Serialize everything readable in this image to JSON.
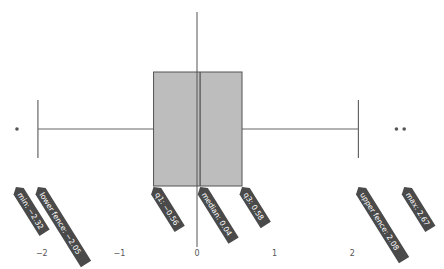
{
  "chart_data": {
    "type": "box",
    "title": "",
    "xlabel": "",
    "ylabel": "",
    "orientation": "horizontal",
    "xlim": [
      -2.5,
      3.1
    ],
    "x_ticks": [
      -2,
      -1,
      0,
      1,
      2
    ],
    "x_tick_labels": [
      "−2",
      "−1",
      "0",
      "1",
      "2"
    ],
    "grid": false,
    "stats": {
      "min": -2.32,
      "lower_fence": -2.05,
      "q1": -0.56,
      "median": 0.04,
      "q3": 0.58,
      "upper_fence": 2.08,
      "max": 2.67
    },
    "outliers": [
      -2.32,
      2.57,
      2.67
    ],
    "annotations": [
      {
        "key": "min",
        "label": "min: −2.32",
        "value": -2.32
      },
      {
        "key": "lower_fence",
        "label": "lower fence: −2.05",
        "value": -2.05
      },
      {
        "key": "q1",
        "label": "q1: −0.56",
        "value": -0.56
      },
      {
        "key": "median",
        "label": "median: 0.04",
        "value": 0.04
      },
      {
        "key": "q3",
        "label": "q3: 0.58",
        "value": 0.58
      },
      {
        "key": "upper_fence",
        "label": "upper fence: 2.08",
        "value": 2.08
      },
      {
        "key": "max",
        "label": "max: 2.67",
        "value": 2.67
      }
    ],
    "colors": {
      "box_fill": "#bdbdbd",
      "box_stroke": "#555555",
      "whisker": "#666666",
      "outlier": "#555555",
      "zero_line": "#555555",
      "annotation_bg": "#4a4a4a",
      "annotation_text": "#ffffff"
    }
  }
}
